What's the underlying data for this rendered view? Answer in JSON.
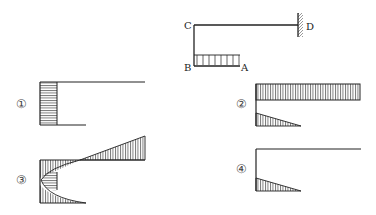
{
  "problem_figure": {
    "description": "Frame C-D fixed at D, cantilever CB downward, BA horizontal with uniformly distributed load",
    "points": {
      "A": "A",
      "B": "B",
      "C": "C",
      "D": "D"
    }
  },
  "options": [
    {
      "label": "①",
      "description": "Rectangular hatched moment on vertical member only"
    },
    {
      "label": "②",
      "description": "Rectangular hatched on top member, triangle on bottom member"
    },
    {
      "label": "③",
      "description": "Triangle on top member, parabolic on vertical member, triangle on bottom member"
    },
    {
      "label": "④",
      "description": "Triangle on bottom member only"
    }
  ],
  "colors": {
    "line": "#222222",
    "hatch": "#333333",
    "background": "#ffffff"
  }
}
